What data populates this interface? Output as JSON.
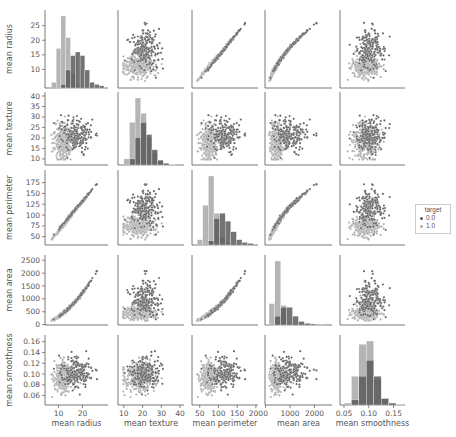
{
  "chart_data": {
    "type": "pairplot",
    "title": "",
    "variables": [
      "mean radius",
      "mean texture",
      "mean perimeter",
      "mean area",
      "mean smoothness"
    ],
    "hue": "target",
    "legend": {
      "title": "target",
      "position": "right",
      "entries": [
        {
          "label": "0.0",
          "color": "#5a5a5a"
        },
        {
          "label": "1.0",
          "color": "#a8a8a8"
        }
      ]
    },
    "diagonal": "histogram",
    "offdiagonal": "scatter",
    "axes": {
      "mean radius": {
        "range": [
          6,
          29
        ],
        "ticks": [
          10,
          20
        ],
        "yticks": [
          10,
          15,
          20,
          25
        ]
      },
      "mean texture": {
        "range": [
          9,
          40
        ],
        "ticks": [
          10,
          20,
          30,
          40
        ],
        "yticks": [
          10,
          15,
          20,
          25,
          30,
          35,
          40
        ]
      },
      "mean perimeter": {
        "range": [
          40,
          195
        ],
        "ticks": [
          50,
          100,
          150,
          200
        ],
        "yticks": [
          50,
          75,
          100,
          125,
          150,
          175
        ]
      },
      "mean area": {
        "range": [
          140,
          2550
        ],
        "ticks": [
          0,
          1000,
          2000
        ],
        "yticks": [
          0,
          500,
          1000,
          1500,
          2000,
          2500
        ]
      },
      "mean smoothness": {
        "range": [
          0.05,
          0.165
        ],
        "ticks": [
          0.05,
          0.1,
          0.15
        ],
        "yticks": [
          0.06,
          0.08,
          0.1,
          0.12,
          0.14,
          0.16
        ]
      }
    },
    "histograms": {
      "mean radius": {
        "bins": [
          7,
          9,
          11,
          13,
          15,
          17,
          19,
          21,
          23,
          25,
          27,
          29
        ],
        "class_1.0": [
          8,
          55,
          100,
          70,
          20,
          5,
          0,
          0,
          0,
          0,
          0
        ],
        "class_0.0": [
          0,
          0,
          5,
          25,
          45,
          50,
          45,
          25,
          8,
          5,
          3
        ]
      },
      "mean texture": {
        "bins": [
          10,
          13,
          16,
          19,
          22,
          25,
          28,
          31,
          34,
          37,
          40
        ],
        "class_1.0": [
          10,
          70,
          110,
          85,
          45,
          20,
          8,
          3,
          1,
          0
        ],
        "class_0.0": [
          0,
          10,
          45,
          70,
          50,
          25,
          8,
          3,
          0,
          1
        ]
      },
      "mean perimeter": {
        "bins": [
          43,
          58,
          73,
          88,
          103,
          118,
          133,
          148,
          163,
          178,
          193
        ],
        "class_1.0": [
          10,
          75,
          130,
          60,
          15,
          5,
          0,
          0,
          0,
          0
        ],
        "class_0.0": [
          0,
          0,
          8,
          50,
          60,
          45,
          25,
          10,
          5,
          3
        ]
      },
      "mean area": {
        "bins": [
          140,
          380,
          620,
          860,
          1100,
          1340,
          1580,
          1820,
          2060,
          2300,
          2540
        ],
        "class_1.0": [
          60,
          180,
          55,
          5,
          0,
          0,
          0,
          0,
          0,
          0
        ],
        "class_0.0": [
          0,
          25,
          50,
          50,
          25,
          10,
          5,
          3,
          2,
          2
        ]
      },
      "mean smoothness": {
        "bins": [
          0.05,
          0.065,
          0.08,
          0.095,
          0.11,
          0.125,
          0.14,
          0.155,
          0.17
        ],
        "class_1.0": [
          3,
          45,
          95,
          100,
          40,
          10,
          3,
          1
        ],
        "class_0.0": [
          0,
          8,
          45,
          70,
          45,
          10,
          3,
          0
        ]
      }
    }
  }
}
